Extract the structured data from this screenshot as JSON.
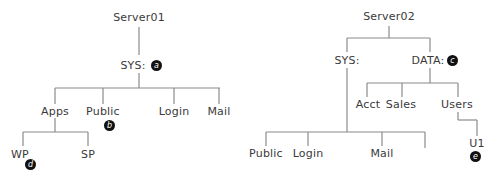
{
  "diagram": {
    "type": "directory-tree",
    "line_color": "#8a8a8a",
    "badge_color": "#111111",
    "server01": {
      "root": "Server01",
      "volume": "SYS:",
      "volume_badge": "a",
      "children": [
        "Apps",
        "Public",
        "Login",
        "Mail"
      ],
      "public_badge": "b",
      "apps_children": [
        "WP",
        "SP"
      ],
      "wp_badge": "d"
    },
    "server02": {
      "root": "Server02",
      "volumes": [
        "SYS:",
        "DATA:"
      ],
      "data_badge": "c",
      "data_children": [
        "Acct",
        "Sales",
        "Users"
      ],
      "users_children": [
        "U1"
      ],
      "u1_badge": "e",
      "sys_children": [
        "Public",
        "Login",
        "Mail",
        ""
      ]
    }
  }
}
